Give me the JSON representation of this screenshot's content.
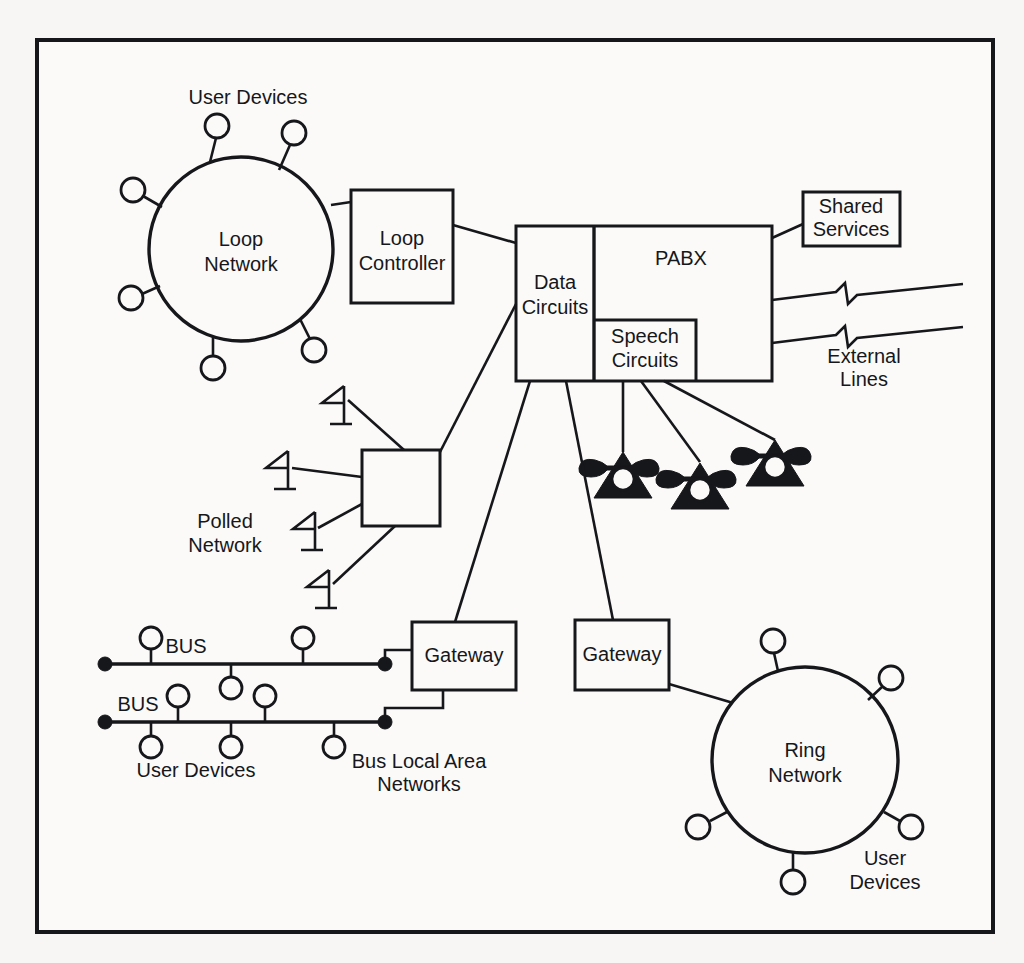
{
  "diagram": {
    "type": "network-topology",
    "frame": {
      "x": 37,
      "y": 40,
      "width": 956,
      "height": 892
    },
    "colors": {
      "ink": "#16171b",
      "paper": "#fbfaf8",
      "page_background": "#f7f6f4"
    },
    "nodes": {
      "loop_network": {
        "label_line1": "Loop",
        "label_line2": "Network",
        "shape": "circle",
        "cx": 241,
        "cy": 249,
        "r": 92,
        "user_device_count": 6
      },
      "loop_controller": {
        "label_line1": "Loop",
        "label_line2": "Controller",
        "shape": "rect",
        "x": 351,
        "y": 190,
        "width": 102,
        "height": 113
      },
      "data_circuits": {
        "label_line1": "Data",
        "label_line2": "Circuits",
        "shape": "rect",
        "x": 516,
        "y": 226,
        "width": 78,
        "height": 155
      },
      "pabx": {
        "label": "PABX",
        "shape": "rect",
        "x": 594,
        "y": 226,
        "width": 178,
        "height": 155
      },
      "speech_circuits": {
        "label_line1": "Speech",
        "label_line2": "Circuits",
        "shape": "rect",
        "x": 594,
        "y": 320,
        "width": 102,
        "height": 61
      },
      "shared_services": {
        "label_line1": "Shared",
        "label_line2": "Services",
        "shape": "rect",
        "x": 803,
        "y": 192,
        "width": 97,
        "height": 54
      },
      "polled_network_node": {
        "label_line1": "Polled",
        "label_line2": "Network",
        "shape": "rect",
        "x": 362,
        "y": 450,
        "width": 78,
        "height": 76,
        "terminal_count": 4
      },
      "gateway_left": {
        "label": "Gateway",
        "shape": "rect",
        "x": 412,
        "y": 622,
        "width": 104,
        "height": 68
      },
      "gateway_right": {
        "label": "Gateway",
        "shape": "rect",
        "x": 575,
        "y": 620,
        "width": 94,
        "height": 70
      },
      "ring_network": {
        "label_line1": "Ring",
        "label_line2": "Network",
        "shape": "circle",
        "cx": 805,
        "cy": 760,
        "r": 93,
        "user_device_count": 5
      },
      "telephones": {
        "count": 3,
        "positions": [
          {
            "cx": 623,
            "cy": 473
          },
          {
            "cx": 700,
            "cy": 484
          },
          {
            "cx": 775,
            "cy": 461
          }
        ]
      },
      "bus_top": {
        "label": "BUS",
        "y": 664,
        "x_start": 105,
        "x_end": 385,
        "devices_above": [
          151,
          303
        ],
        "devices_below": [
          231
        ]
      },
      "bus_bottom": {
        "label": "BUS",
        "y": 722,
        "x_start": 105,
        "x_end": 385,
        "devices_above": [
          178,
          265
        ],
        "devices_below": [
          151,
          231,
          334
        ]
      }
    },
    "labels": {
      "user_devices_loop": "User Devices",
      "user_devices_bus": "User Devices",
      "user_devices_ring_line1": "User",
      "user_devices_ring_line2": "Devices",
      "external_lines_line1": "External",
      "external_lines_line2": "Lines",
      "bus_lan_line1": "Bus Local Area",
      "bus_lan_line2": "Networks"
    },
    "external_lines": {
      "count": 2,
      "has_break_symbol": true
    }
  }
}
